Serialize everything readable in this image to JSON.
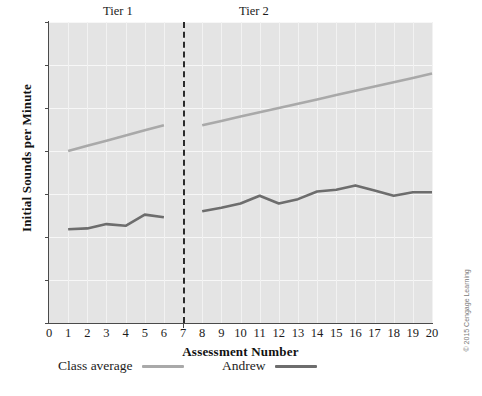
{
  "chart_data": {
    "type": "line",
    "title": "",
    "xlabel": "Assessment Number",
    "ylabel": "Initial Sounds per Minute",
    "xlim": [
      0,
      20
    ],
    "ylim": [
      0,
      35
    ],
    "xticks": [
      0,
      1,
      2,
      3,
      4,
      5,
      6,
      7,
      8,
      9,
      10,
      11,
      12,
      13,
      14,
      15,
      16,
      17,
      18,
      19,
      20
    ],
    "yticks": [
      0,
      5,
      10,
      15,
      20,
      25,
      30,
      35
    ],
    "grid": true,
    "legend_position": "bottom",
    "phase_divider_x": 7,
    "phase_labels": [
      {
        "label": "Tier 1",
        "x_center": 3.6
      },
      {
        "label": "Tier 2",
        "x_center": 10.7
      }
    ],
    "series": [
      {
        "name": "Class average",
        "color": "#a9a9a9",
        "segments": [
          {
            "phase": "Tier 1",
            "x": [
              1,
              2,
              3,
              4,
              5,
              6
            ],
            "values": [
              20.0,
              20.6,
              21.2,
              21.8,
              22.4,
              23.0
            ]
          },
          {
            "phase": "Tier 2",
            "x": [
              8,
              9,
              10,
              11,
              12,
              13,
              14,
              15,
              16,
              17,
              18,
              19,
              20
            ],
            "values": [
              23.0,
              23.5,
              24.0,
              24.5,
              25.0,
              25.5,
              26.0,
              26.5,
              27.0,
              27.5,
              28.0,
              28.5,
              29.0
            ]
          }
        ]
      },
      {
        "name": "Andrew",
        "color": "#6d6d6d",
        "segments": [
          {
            "phase": "Tier 1",
            "x": [
              1,
              2,
              3,
              4,
              5,
              6
            ],
            "values": [
              10.9,
              11.0,
              11.5,
              11.3,
              12.6,
              12.3
            ]
          },
          {
            "phase": "Tier 2",
            "x": [
              8,
              9,
              10,
              11,
              12,
              13,
              14,
              15,
              16,
              17,
              18,
              19,
              20
            ],
            "values": [
              13.0,
              13.4,
              13.9,
              14.8,
              13.9,
              14.4,
              15.3,
              15.5,
              16.0,
              15.4,
              14.8,
              15.2,
              15.2
            ]
          }
        ]
      }
    ]
  },
  "legend": {
    "items": [
      {
        "label": "Class average",
        "color": "#a9a9a9"
      },
      {
        "label": "Andrew",
        "color": "#6d6d6d"
      }
    ]
  },
  "credit": {
    "text": "© 2015 Cengage Learning"
  },
  "colors": {
    "plot_background": "#e4e4e4",
    "gridline": "#f7f7f7",
    "axis": "#4a4a4a",
    "divider": "#2a2a2a",
    "class_average": "#a9a9a9",
    "andrew": "#6d6d6d",
    "text": "#1c1c1c"
  }
}
